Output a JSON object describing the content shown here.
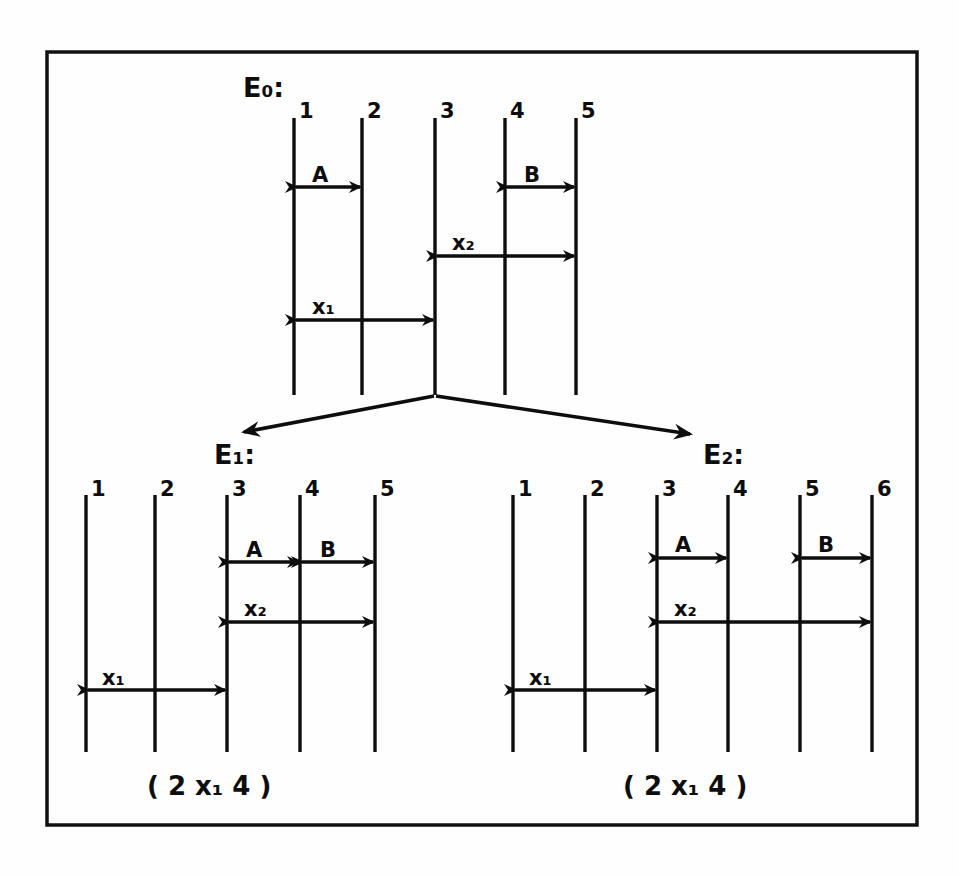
{
  "figure": {
    "title_visible": false,
    "border_color": "#111111",
    "ink_color": "#0d0d0d",
    "background": "#fefefe",
    "style_note": "hand-drawn photocopied timing/event diagram"
  },
  "diagrams": [
    {
      "id": "E0",
      "label": "E₀:",
      "label_plain": "E0:",
      "line_labels": [
        "1",
        "2",
        "3",
        "4",
        "5"
      ],
      "arrows": [
        {
          "name": "A",
          "label": "A",
          "from_line": "1",
          "to_line": "2",
          "double_headed": true
        },
        {
          "name": "B",
          "label": "B",
          "from_line": "4",
          "to_line": "5",
          "double_headed": true
        },
        {
          "name": "x2",
          "label": "x₂",
          "label_plain": "x2",
          "from_line": "3",
          "to_line": "5",
          "double_headed": true
        },
        {
          "name": "x1",
          "label": "x₁",
          "label_plain": "x1",
          "from_line": "1",
          "to_line": "3",
          "double_headed": true
        }
      ],
      "caption": ""
    },
    {
      "id": "E1",
      "label": "E₁:",
      "label_plain": "E1:",
      "line_labels": [
        "1",
        "2",
        "3",
        "4",
        "5"
      ],
      "arrows": [
        {
          "name": "A",
          "label": "A",
          "from_line": "3",
          "to_line": "4",
          "double_headed": true
        },
        {
          "name": "B",
          "label": "B",
          "from_line": "4",
          "to_line": "5",
          "double_headed": true
        },
        {
          "name": "x2",
          "label": "x₂",
          "label_plain": "x2",
          "from_line": "3",
          "to_line": "5",
          "double_headed": true
        },
        {
          "name": "x1",
          "label": "x₁",
          "label_plain": "x1",
          "from_line": "1",
          "to_line": "3",
          "double_headed": true
        }
      ],
      "caption": "( 2  x₁ 4 )",
      "caption_plain": "( 2 x1 4 )"
    },
    {
      "id": "E2",
      "label": "E₂:",
      "label_plain": "E2:",
      "line_labels": [
        "1",
        "2",
        "3",
        "4",
        "5",
        "6"
      ],
      "arrows": [
        {
          "name": "A",
          "label": "A",
          "from_line": "3",
          "to_line": "4",
          "double_headed": true
        },
        {
          "name": "B",
          "label": "B",
          "from_line": "5",
          "to_line": "6",
          "double_headed": true
        },
        {
          "name": "x2",
          "label": "x₂",
          "label_plain": "x2",
          "from_line": "3",
          "to_line": "6",
          "double_headed": true
        },
        {
          "name": "x1",
          "label": "x₁",
          "label_plain": "x1",
          "from_line": "1",
          "to_line": "3",
          "double_headed": true
        }
      ],
      "caption": "( 2  x₁ 4 )",
      "caption_plain": "( 2 x1 4 )"
    }
  ],
  "branch_arrows": [
    {
      "name": "branch-left",
      "from": "E0",
      "to": "E1",
      "direction": "down-left"
    },
    {
      "name": "branch-right",
      "from": "E0",
      "to": "E2",
      "direction": "down-right"
    }
  ],
  "text_nodes": {
    "e0_label": "E₀:",
    "e1_label": "E₁:",
    "e2_label": "E₂:",
    "caption_left": "( 2  x₁ 4 )",
    "caption_right": "( 2  x₁ 4 )",
    "e0_n1": "1",
    "e0_n2": "2",
    "e0_n3": "3",
    "e0_n4": "4",
    "e0_n5": "5",
    "e0_A": "A",
    "e0_B": "B",
    "e0_x2": "x₂",
    "e0_x1": "x₁",
    "e1_n1": "1",
    "e1_n2": "2",
    "e1_n3": "3",
    "e1_n4": "4",
    "e1_n5": "5",
    "e1_A": "A",
    "e1_B": "B",
    "e1_x2": "x₂",
    "e1_x1": "x₁",
    "e2_n1": "1",
    "e2_n2": "2",
    "e2_n3": "3",
    "e2_n4": "4",
    "e2_n5": "5",
    "e2_n6": "6",
    "e2_A": "A",
    "e2_B": "B",
    "e2_x2": "x₂",
    "e2_x1": "x₁"
  }
}
